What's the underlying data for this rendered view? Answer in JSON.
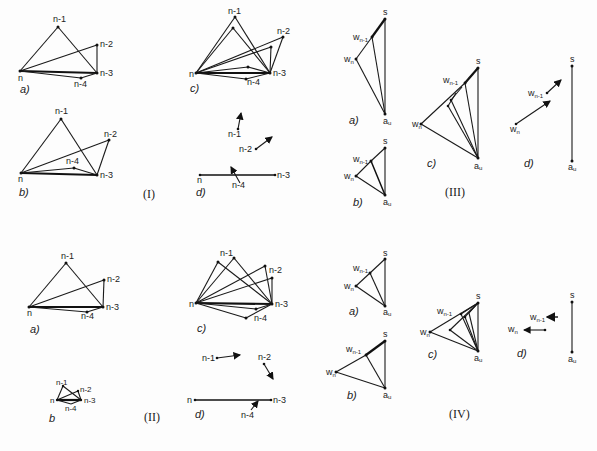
{
  "figure": {
    "panels": [
      {
        "id": "I",
        "label": "(I)",
        "subfigures": [
          {
            "id": "a",
            "label": "a)",
            "nodes": [
              "n",
              "n-1",
              "n-2",
              "n-3",
              "n-4"
            ]
          },
          {
            "id": "b",
            "label": "b)",
            "nodes": [
              "n",
              "n-1",
              "n-2",
              "n-3",
              "n-4"
            ]
          },
          {
            "id": "c",
            "label": "c)",
            "nodes": [
              "n",
              "n-1",
              "n-2",
              "n-3",
              "n-4"
            ]
          },
          {
            "id": "d",
            "label": "d)",
            "nodes": [
              "n",
              "n-1",
              "n-2",
              "n-3",
              "n-4"
            ]
          }
        ]
      },
      {
        "id": "II",
        "label": "(II)",
        "subfigures": [
          {
            "id": "a",
            "label": "a)",
            "nodes": [
              "n",
              "n-1",
              "n-2",
              "n-3",
              "n-4"
            ]
          },
          {
            "id": "b",
            "label": "b",
            "nodes": [
              "n",
              "n-1",
              "n-2",
              "n-3",
              "n-4"
            ]
          },
          {
            "id": "c",
            "label": "c)",
            "nodes": [
              "n",
              "n-1",
              "n-2",
              "n-3",
              "n-4"
            ]
          },
          {
            "id": "d",
            "label": "d)",
            "nodes": [
              "n",
              "n-1",
              "n-2",
              "n-3",
              "n-4"
            ]
          }
        ]
      },
      {
        "id": "III",
        "label": "(III)",
        "subfigures": [
          {
            "id": "a",
            "label": "a)",
            "nodes": [
              "s",
              "w_n-1",
              "w_n",
              "a_u"
            ]
          },
          {
            "id": "b",
            "label": "b)",
            "nodes": [
              "s",
              "w_n-1",
              "w_n",
              "a_u"
            ]
          },
          {
            "id": "c",
            "label": "c)",
            "nodes": [
              "s",
              "w_n-1",
              "w_n",
              "a_u"
            ]
          },
          {
            "id": "d",
            "label": "d)",
            "nodes": [
              "s",
              "w_n-1",
              "w_n",
              "a_u"
            ]
          }
        ]
      },
      {
        "id": "IV",
        "label": "(IV)",
        "subfigures": [
          {
            "id": "a",
            "label": "a)",
            "nodes": [
              "s",
              "w_n-1",
              "w_n",
              "a_u"
            ]
          },
          {
            "id": "b",
            "label": "b)",
            "nodes": [
              "s",
              "w_n-1",
              "w_n",
              "a_u"
            ]
          },
          {
            "id": "c",
            "label": "c)",
            "nodes": [
              "s",
              "w_n-1",
              "w_n",
              "a_u"
            ]
          },
          {
            "id": "d",
            "label": "d)",
            "nodes": [
              "s",
              "w_n-1",
              "w_n",
              "a_u"
            ]
          }
        ]
      }
    ],
    "labels": {
      "n": "n",
      "n1": "n-1",
      "n2": "n-2",
      "n3": "n-3",
      "n4": "n-4",
      "s": "s",
      "w": "w",
      "sub_n": "n",
      "sub_n1": "n-1",
      "a": "a",
      "sub_u": "u",
      "a_paren": "a)",
      "b_paren": "b)",
      "b_plain": "b",
      "c_paren": "c)",
      "d_paren": "d)",
      "roman_I": "(I)",
      "roman_II": "(II)",
      "roman_III": "(III)",
      "roman_IV": "(IV)"
    }
  }
}
